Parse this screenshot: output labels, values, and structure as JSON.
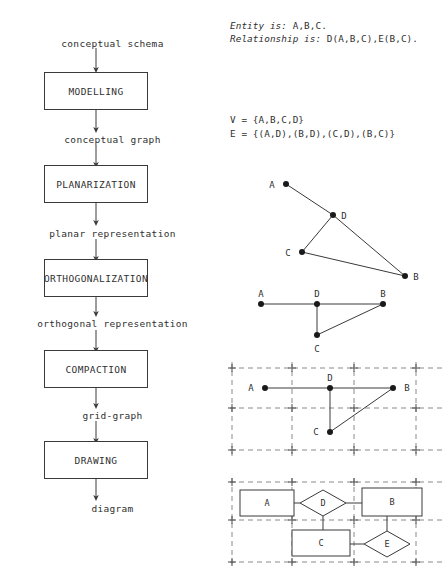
{
  "flowchart": {
    "title": "graph-drawing-pipeline",
    "start_label": "conceptual schema",
    "steps": [
      {
        "box": "MODELLING",
        "output": "conceptual graph"
      },
      {
        "box": "PLANARIZATION",
        "output": "planar representation"
      },
      {
        "box": "ORTHOGONALIZATION",
        "output": "orthogonal representation"
      },
      {
        "box": "COMPACTION",
        "output": "grid-graph"
      },
      {
        "box": "DRAWING",
        "output": "diagram"
      }
    ]
  },
  "schema": {
    "entity_keyword": "Entity is:",
    "entity_value": "A,B,C.",
    "relationship_keyword": "Relationship is:",
    "relationship_value": "D(A,B,C),E(B,C)."
  },
  "graph_sets": {
    "vertices_line": "V = {A,B,C,D}",
    "edges_line": "E = {(A,D),(B,D),(C,D),(B,C)}"
  },
  "conceptual_graph": {
    "caption": "conceptual-graph-drawing",
    "nodes": [
      {
        "id": "A",
        "x": 41,
        "y": 16,
        "label_dx": -14,
        "label_dy": 1
      },
      {
        "id": "D",
        "x": 88,
        "y": 47,
        "label_dx": 11,
        "label_dy": 1
      },
      {
        "id": "C",
        "x": 57,
        "y": 84,
        "label_dx": -14,
        "label_dy": 1
      },
      {
        "id": "B",
        "x": 160,
        "y": 108,
        "label_dx": 11,
        "label_dy": 1
      }
    ],
    "edges": [
      [
        "A",
        "D"
      ],
      [
        "D",
        "C"
      ],
      [
        "D",
        "B"
      ],
      [
        "C",
        "B"
      ]
    ]
  },
  "planar_graph": {
    "caption": "planar-orthogonal-representation",
    "nodes": [
      {
        "id": "A",
        "x": 16,
        "y": 14,
        "label_dx": 0,
        "label_dy": -10
      },
      {
        "id": "D",
        "x": 72,
        "y": 14,
        "label_dx": 0,
        "label_dy": -10
      },
      {
        "id": "B",
        "x": 138,
        "y": 14,
        "label_dx": 0,
        "label_dy": -10
      },
      {
        "id": "C",
        "x": 72,
        "y": 45,
        "label_dx": 0,
        "label_dy": 14
      }
    ],
    "edges": [
      [
        "A",
        "D"
      ],
      [
        "D",
        "B"
      ],
      [
        "D",
        "C"
      ],
      [
        "C",
        "B"
      ]
    ]
  },
  "grid_graph": {
    "caption": "grid-graph-drawing",
    "grid": {
      "x_lines": [
        2,
        62,
        124,
        186
      ],
      "y_lines": [
        6,
        46,
        88
      ],
      "width": 212,
      "height": 94
    },
    "nodes": [
      {
        "id": "A",
        "x": 35,
        "y": 26,
        "label_dx": -14,
        "label_dy": 0
      },
      {
        "id": "D",
        "x": 100,
        "y": 26,
        "label_dx": 0,
        "label_dy": -10
      },
      {
        "id": "B",
        "x": 163,
        "y": 26,
        "label_dx": 14,
        "label_dy": 0
      },
      {
        "id": "C",
        "x": 100,
        "y": 70,
        "label_dx": -14,
        "label_dy": 0
      }
    ],
    "edges": [
      [
        "A",
        "D"
      ],
      [
        "D",
        "B"
      ],
      [
        "D",
        "C"
      ],
      [
        "C",
        "B"
      ]
    ]
  },
  "er_diagram": {
    "caption": "final-entity-relationship-diagram",
    "grid": {
      "x_lines": [
        2,
        62,
        124,
        186
      ],
      "y_lines": [
        4,
        42,
        84
      ],
      "width": 212,
      "height": 90
    },
    "entities": [
      {
        "id": "A",
        "x": 10,
        "y": 12,
        "w": 54,
        "h": 26
      },
      {
        "id": "B",
        "x": 132,
        "y": 10,
        "w": 60,
        "h": 28
      },
      {
        "id": "C",
        "x": 62,
        "y": 52,
        "w": 58,
        "h": 26
      }
    ],
    "relationships": [
      {
        "id": "D",
        "cx": 93,
        "cy": 25,
        "rx": 23,
        "ry": 13
      },
      {
        "id": "E",
        "cx": 157,
        "cy": 66,
        "rx": 23,
        "ry": 13
      }
    ],
    "links": [
      {
        "from": "A",
        "to": "D",
        "x1": 64,
        "y1": 25,
        "x2": 70,
        "y2": 25
      },
      {
        "from": "D",
        "to": "B",
        "x1": 116,
        "y1": 25,
        "x2": 132,
        "y2": 25
      },
      {
        "from": "D",
        "to": "C",
        "x1": 93,
        "y1": 38,
        "x2": 93,
        "y2": 52
      },
      {
        "from": "C",
        "to": "E",
        "x1": 120,
        "y1": 66,
        "x2": 134,
        "y2": 66
      },
      {
        "from": "B",
        "to": "E",
        "x1": 157,
        "y1": 38,
        "x2": 157,
        "y2": 53
      }
    ]
  }
}
